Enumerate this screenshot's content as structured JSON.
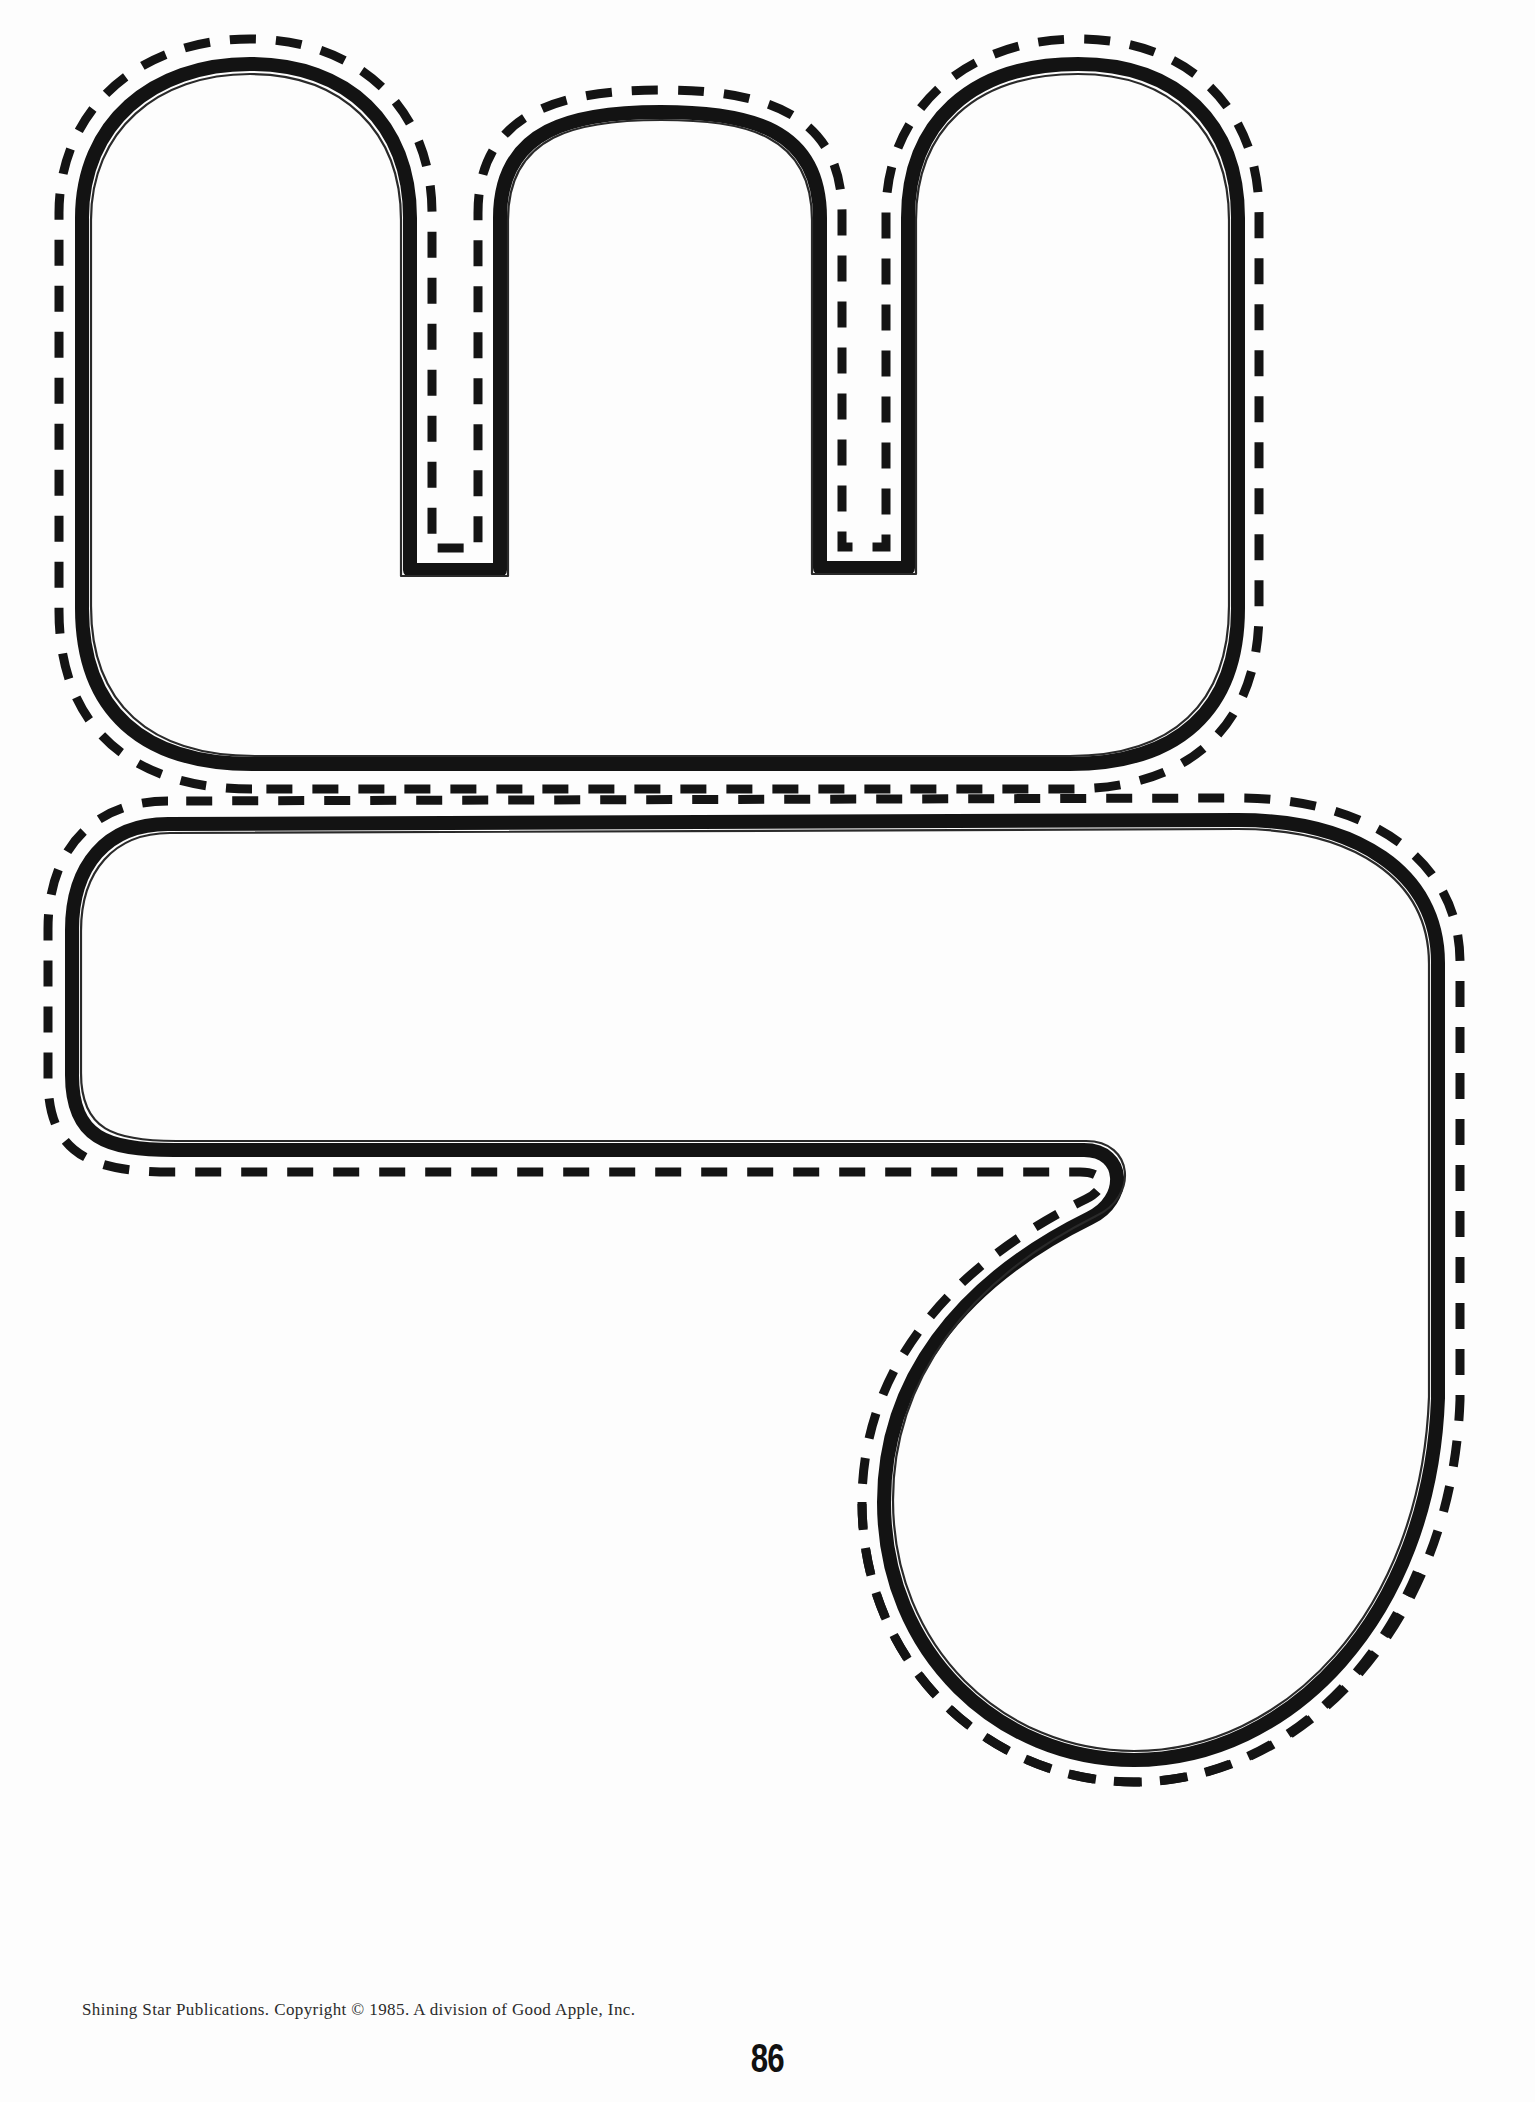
{
  "page": {
    "kind": "letter-cutout-worksheet",
    "background_color": "#ffffff",
    "width": 1535,
    "height": 2102,
    "page_number": "86",
    "credit_line": "Shining Star Publications. Copyright © 1985. A division of Good Apple, Inc."
  },
  "ink": {
    "outline_color": "#111111",
    "dash_color": "#111111",
    "outline_stroke_px": 13,
    "dash_stroke_px": 9,
    "dash_pattern": "26 20"
  },
  "shapes": [
    {
      "id": "letter-m",
      "name": "lowercase-letter-m-cutout",
      "label": "m",
      "description": "Lowercase letter m bubble outline with two notches, solid heavy outline plus an outer dashed cutting line.",
      "bounds": {
        "x": 70,
        "y": 45,
        "width": 1445,
        "height": 715
      },
      "outline_path": "M 243 770 C 128 770 78 718 78 612 L 78 215 C 78 120 152 58 248 58 C 344 58 412 120 412 215 L 412 562 L 498 562 L 498 215 C 498 122 570 108 660 108 C 752 108 822 122 822 215 L 822 560 L 906 560 L 906 215 C 906 120 980 58 1078 58 C 1174 58 1240 120 1240 215 L 1240 612 C 1240 718 1190 770 1076 770 Z",
      "dash_path": "M 243 770 C 128 770 78 718 78 612 L 78 215 C 78 120 152 58 248 58 C 344 58 412 120 412 215 L 412 562 L 498 562 L 498 215 C 498 122 570 108 660 108 C 752 108 822 122 822 215 L 822 560 L 906 560 L 906 215 C 906 120 980 58 1078 58 C 1174 58 1240 120 1240 215 L 1240 612 C 1240 718 1190 770 1076 770 Z",
      "dash_offset_px": 14
    },
    {
      "id": "letter-g-tail",
      "name": "lowercase-letter-g-cutout",
      "label": "g",
      "description": "Lowercase g bowl and descender hook outline, solid heavy outline plus an outer dashed cutting line, bottom hook runs to the page edge.",
      "bounds": {
        "x": 55,
        "y": 800,
        "width": 1460,
        "height": 1270
      },
      "outline_path": "M 160 815 C 96 815 62 860 62 928 L 62 1072 C 62 1140 96 1150 170 1150 L 1092 1150 C 1140 1150 1140 1206 1096 1224 C 960 1282 880 1380 880 1500 C 880 1660 1000 1760 1130 1760 C 1300 1760 1430 1620 1440 1380 L 1440 960 C 1440 870 1360 812 1230 812 Z",
      "dash_offset_px": 14
    }
  ],
  "footer": {
    "credit": "Shining Star Publications. Copyright © 1985. A division of Good Apple, Inc.",
    "page_number": "86"
  }
}
